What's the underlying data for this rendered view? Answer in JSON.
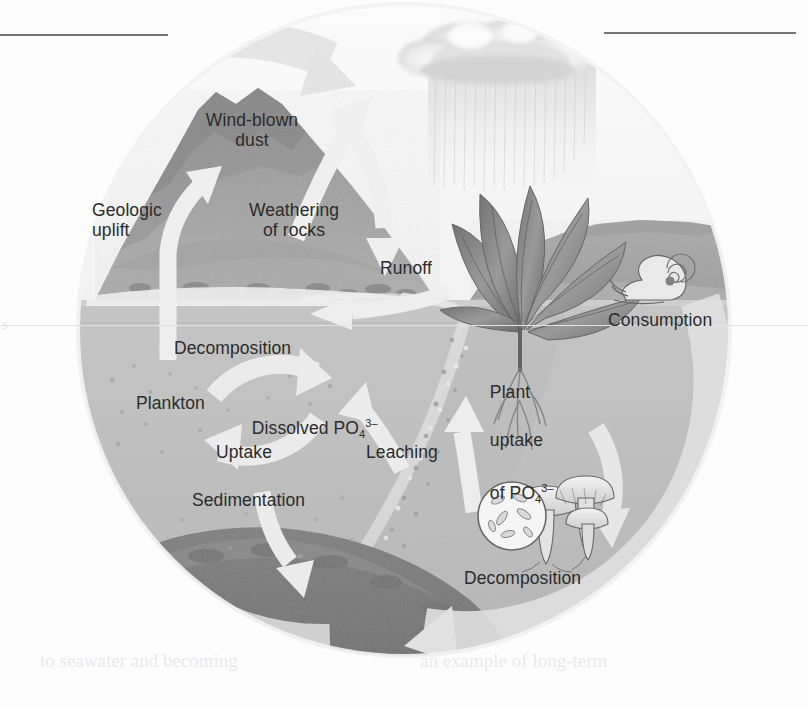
{
  "figure": {
    "type": "scientific-illustration-diagram"
  },
  "labels": {
    "wind_blown_dust": "Wind-blown\ndust",
    "geologic_uplift": "Geologic\nuplift",
    "weathering_of_rocks": "Weathering\nof rocks",
    "runoff": "Runoff",
    "consumption": "Consumption",
    "decomposition_water": "Decomposition",
    "plankton": "Plankton",
    "dissolved_phosphate_pre": "Dissolved PO",
    "dissolved_phosphate_sub": "4",
    "dissolved_phosphate_sup": "3–",
    "uptake": "Uptake",
    "sedimentation": "Sedimentation",
    "leaching": "Leaching",
    "plant_uptake_l1": "Plant",
    "plant_uptake_l2": "uptake",
    "plant_uptake_l3_pre": "of PO",
    "plant_uptake_l3_sub": "4",
    "plant_uptake_l3_sup": "3–",
    "decomposition_land": "Decomposition"
  },
  "icons": {
    "cloud": "cloud-icon",
    "rain": "rain-icon",
    "mountain": "mountain-icon",
    "plant": "plant-icon",
    "snail": "snail-icon",
    "mushroom": "mushroom-icon",
    "bacteria": "bacteria-icon",
    "plankton": "plankton-icon",
    "seafloor": "sediment-icon"
  },
  "page_artifacts": {
    "rule_left": "",
    "rule_right": "",
    "edge_char": "s",
    "ghost_line_1": "to seawater and becoming",
    "ghost_line_2": "an example of long-term"
  },
  "colors": {
    "background": "#fdfdfd",
    "circle_band": "#e4e4e6",
    "sky": "#f3f3f3",
    "water": "#b6b6b6",
    "water_deep": "#a6a6a6",
    "seafloor": "#6d6d6d",
    "mountain": "#8e8e8e",
    "mountain_dark": "#707070",
    "land_right": "#9a9a9a",
    "arrow": "#ececec",
    "arrow_shadow": "#d5d5d5",
    "text": "#2b2b2b",
    "rule": "#5c5c5c"
  }
}
